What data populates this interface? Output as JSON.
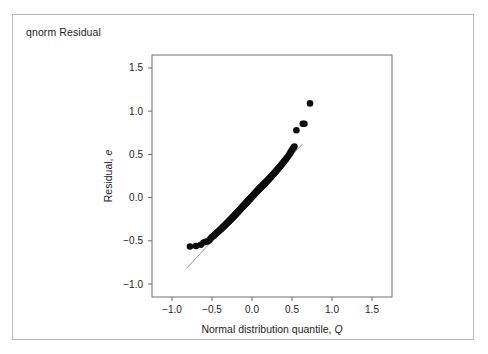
{
  "figure": {
    "title": "qnorm Residual",
    "border_color": "#b9b9b9",
    "background": "#ffffff"
  },
  "chart_data": {
    "type": "scatter",
    "title": "qnorm Residual",
    "xlabel": "Normal distribution quantile, Q",
    "xlabel_plain": "Normal distribution quantile,",
    "xlabel_italic": "Q",
    "ylabel": "Residual, e",
    "ylabel_plain": "Residual,",
    "ylabel_italic": "e",
    "xlim": [
      -1.25,
      1.75
    ],
    "ylim": [
      -1.15,
      1.65
    ],
    "xticks": [
      -1.0,
      -0.5,
      0.0,
      0.5,
      1.0,
      1.5
    ],
    "xtick_labels": [
      "-1.0",
      "-0.5",
      "0.0",
      "0.5",
      "1.0",
      "1.5"
    ],
    "yticks": [
      -1.0,
      -0.5,
      0.0,
      0.5,
      1.0,
      1.5
    ],
    "ytick_labels": [
      "-1.0",
      "-0.5",
      "0.0",
      "0.5",
      "1.0",
      "1.5"
    ],
    "grid": false,
    "legend": null,
    "marker": {
      "shape": "circle",
      "color": "#0d0d0d",
      "size_px": 3.3
    },
    "reference_line": {
      "label": "qq-reference-line",
      "color": "#9a9a9a",
      "x": [
        -0.82,
        0.63
      ],
      "y": [
        -0.82,
        0.62
      ]
    },
    "points": [
      [
        -0.775,
        -0.565
      ],
      [
        -0.7,
        -0.56
      ],
      [
        -0.64,
        -0.545
      ],
      [
        -0.605,
        -0.52
      ],
      [
        -0.575,
        -0.51
      ],
      [
        -0.55,
        -0.505
      ],
      [
        -0.53,
        -0.49
      ],
      [
        -0.515,
        -0.47
      ],
      [
        -0.5,
        -0.455
      ],
      [
        -0.488,
        -0.448
      ],
      [
        -0.476,
        -0.44
      ],
      [
        -0.465,
        -0.43
      ],
      [
        -0.455,
        -0.42
      ],
      [
        -0.445,
        -0.412
      ],
      [
        -0.436,
        -0.405
      ],
      [
        -0.427,
        -0.398
      ],
      [
        -0.418,
        -0.39
      ],
      [
        -0.41,
        -0.383
      ],
      [
        -0.402,
        -0.376
      ],
      [
        -0.394,
        -0.37
      ],
      [
        -0.386,
        -0.363
      ],
      [
        -0.379,
        -0.357
      ],
      [
        -0.372,
        -0.35
      ],
      [
        -0.365,
        -0.344
      ],
      [
        -0.358,
        -0.338
      ],
      [
        -0.351,
        -0.332
      ],
      [
        -0.345,
        -0.326
      ],
      [
        -0.338,
        -0.32
      ],
      [
        -0.332,
        -0.315
      ],
      [
        -0.326,
        -0.309
      ],
      [
        -0.32,
        -0.303
      ],
      [
        -0.314,
        -0.298
      ],
      [
        -0.308,
        -0.292
      ],
      [
        -0.302,
        -0.287
      ],
      [
        -0.296,
        -0.282
      ],
      [
        -0.291,
        -0.276
      ],
      [
        -0.285,
        -0.271
      ],
      [
        -0.28,
        -0.266
      ],
      [
        -0.274,
        -0.261
      ],
      [
        -0.269,
        -0.256
      ],
      [
        -0.264,
        -0.251
      ],
      [
        -0.259,
        -0.246
      ],
      [
        -0.253,
        -0.241
      ],
      [
        -0.248,
        -0.236
      ],
      [
        -0.243,
        -0.231
      ],
      [
        -0.238,
        -0.226
      ],
      [
        -0.234,
        -0.222
      ],
      [
        -0.229,
        -0.217
      ],
      [
        -0.224,
        -0.212
      ],
      [
        -0.219,
        -0.208
      ],
      [
        -0.214,
        -0.203
      ],
      [
        -0.21,
        -0.198
      ],
      [
        -0.205,
        -0.194
      ],
      [
        -0.201,
        -0.189
      ],
      [
        -0.196,
        -0.185
      ],
      [
        -0.192,
        -0.18
      ],
      [
        -0.187,
        -0.176
      ],
      [
        -0.183,
        -0.172
      ],
      [
        -0.178,
        -0.167
      ],
      [
        -0.174,
        -0.163
      ],
      [
        -0.17,
        -0.159
      ],
      [
        -0.165,
        -0.154
      ],
      [
        -0.161,
        -0.15
      ],
      [
        -0.157,
        -0.146
      ],
      [
        -0.153,
        -0.142
      ],
      [
        -0.148,
        -0.137
      ],
      [
        -0.144,
        -0.133
      ],
      [
        -0.14,
        -0.129
      ],
      [
        -0.136,
        -0.125
      ],
      [
        -0.132,
        -0.121
      ],
      [
        -0.128,
        -0.117
      ],
      [
        -0.124,
        -0.113
      ],
      [
        -0.12,
        -0.109
      ],
      [
        -0.116,
        -0.105
      ],
      [
        -0.112,
        -0.101
      ],
      [
        -0.108,
        -0.097
      ],
      [
        -0.104,
        -0.093
      ],
      [
        -0.1,
        -0.089
      ],
      [
        -0.096,
        -0.085
      ],
      [
        -0.092,
        -0.081
      ],
      [
        -0.088,
        -0.077
      ],
      [
        -0.084,
        -0.073
      ],
      [
        -0.08,
        -0.069
      ],
      [
        -0.076,
        -0.065
      ],
      [
        -0.072,
        -0.061
      ],
      [
        -0.068,
        -0.057
      ],
      [
        -0.064,
        -0.053
      ],
      [
        -0.06,
        -0.049
      ],
      [
        -0.056,
        -0.045
      ],
      [
        -0.052,
        -0.041
      ],
      [
        -0.048,
        -0.037
      ],
      [
        -0.044,
        -0.033
      ],
      [
        -0.04,
        -0.029
      ],
      [
        -0.036,
        -0.025
      ],
      [
        -0.032,
        -0.021
      ],
      [
        -0.028,
        -0.017
      ],
      [
        -0.024,
        -0.013
      ],
      [
        -0.02,
        -0.009
      ],
      [
        -0.016,
        -0.005
      ],
      [
        -0.012,
        -0.001
      ],
      [
        -0.008,
        0.003
      ],
      [
        -0.004,
        0.007
      ],
      [
        0.0,
        0.011
      ],
      [
        0.004,
        0.015
      ],
      [
        0.008,
        0.019
      ],
      [
        0.012,
        0.023
      ],
      [
        0.016,
        0.027
      ],
      [
        0.02,
        0.031
      ],
      [
        0.024,
        0.035
      ],
      [
        0.028,
        0.039
      ],
      [
        0.032,
        0.043
      ],
      [
        0.036,
        0.047
      ],
      [
        0.04,
        0.051
      ],
      [
        0.044,
        0.055
      ],
      [
        0.048,
        0.059
      ],
      [
        0.052,
        0.063
      ],
      [
        0.056,
        0.067
      ],
      [
        0.06,
        0.071
      ],
      [
        0.064,
        0.075
      ],
      [
        0.068,
        0.079
      ],
      [
        0.072,
        0.083
      ],
      [
        0.076,
        0.087
      ],
      [
        0.08,
        0.091
      ],
      [
        0.084,
        0.095
      ],
      [
        0.088,
        0.099
      ],
      [
        0.092,
        0.103
      ],
      [
        0.096,
        0.107
      ],
      [
        0.101,
        0.111
      ],
      [
        0.105,
        0.115
      ],
      [
        0.11,
        0.119
      ],
      [
        0.114,
        0.123
      ],
      [
        0.119,
        0.127
      ],
      [
        0.123,
        0.131
      ],
      [
        0.128,
        0.136
      ],
      [
        0.133,
        0.14
      ],
      [
        0.137,
        0.144
      ],
      [
        0.142,
        0.149
      ],
      [
        0.147,
        0.153
      ],
      [
        0.152,
        0.158
      ],
      [
        0.157,
        0.162
      ],
      [
        0.162,
        0.167
      ],
      [
        0.167,
        0.172
      ],
      [
        0.172,
        0.177
      ],
      [
        0.177,
        0.182
      ],
      [
        0.183,
        0.187
      ],
      [
        0.188,
        0.192
      ],
      [
        0.194,
        0.197
      ],
      [
        0.199,
        0.203
      ],
      [
        0.205,
        0.208
      ],
      [
        0.211,
        0.214
      ],
      [
        0.217,
        0.22
      ],
      [
        0.223,
        0.226
      ],
      [
        0.229,
        0.232
      ],
      [
        0.235,
        0.238
      ],
      [
        0.242,
        0.245
      ],
      [
        0.248,
        0.252
      ],
      [
        0.255,
        0.259
      ],
      [
        0.262,
        0.266
      ],
      [
        0.269,
        0.273
      ],
      [
        0.277,
        0.281
      ],
      [
        0.284,
        0.289
      ],
      [
        0.292,
        0.297
      ],
      [
        0.3,
        0.306
      ],
      [
        0.308,
        0.315
      ],
      [
        0.317,
        0.324
      ],
      [
        0.326,
        0.334
      ],
      [
        0.335,
        0.344
      ],
      [
        0.345,
        0.355
      ],
      [
        0.355,
        0.366
      ],
      [
        0.365,
        0.378
      ],
      [
        0.376,
        0.39
      ],
      [
        0.388,
        0.403
      ],
      [
        0.4,
        0.417
      ],
      [
        0.413,
        0.432
      ],
      [
        0.427,
        0.448
      ],
      [
        0.442,
        0.466
      ],
      [
        0.458,
        0.486
      ],
      [
        0.47,
        0.505
      ],
      [
        0.48,
        0.52
      ],
      [
        0.492,
        0.538
      ],
      [
        0.505,
        0.56
      ],
      [
        0.52,
        0.58
      ],
      [
        0.53,
        0.59
      ],
      [
        0.555,
        0.78
      ],
      [
        0.635,
        0.855
      ],
      [
        0.655,
        0.855
      ],
      [
        0.725,
        1.09
      ]
    ]
  }
}
